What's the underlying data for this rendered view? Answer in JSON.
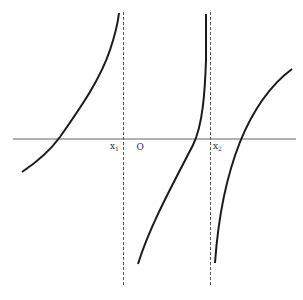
{
  "diagram": {
    "type": "function-graph",
    "axis": {
      "label_origin": "O"
    },
    "asymptotes": [
      {
        "label": "x",
        "subscript": "1"
      },
      {
        "label": "x",
        "subscript": "2"
      }
    ],
    "curves": [
      {
        "name": "left-branch",
        "description": "increasing branch approaching x1 asymptote"
      },
      {
        "name": "middle-branch",
        "description": "increasing branch between x1 and x2"
      },
      {
        "name": "right-branch",
        "description": "increasing branch right of x2"
      }
    ],
    "colors": {
      "curve": "#1a1a1a",
      "axis": "#555555",
      "asymptote": "#555555"
    }
  }
}
